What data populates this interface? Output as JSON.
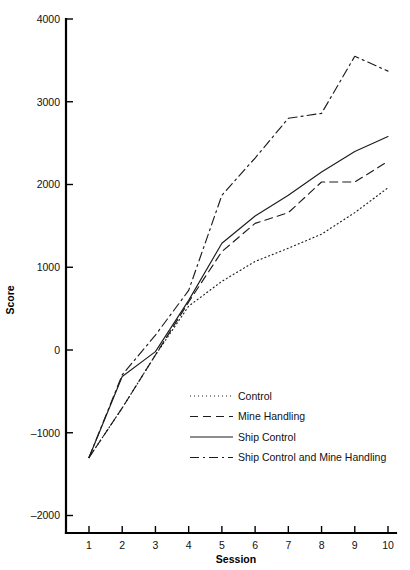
{
  "chart_data": {
    "type": "line",
    "title": "",
    "xlabel": "Session",
    "ylabel": "Score",
    "x": [
      1,
      2,
      3,
      4,
      5,
      6,
      7,
      8,
      9,
      10
    ],
    "xticklabels": [
      "1",
      "2",
      "3",
      "4",
      "5",
      "6",
      "7",
      "8",
      "9",
      "10"
    ],
    "yticks": [
      -2000,
      -1000,
      0,
      1000,
      2000,
      3000,
      4000
    ],
    "yticklabels": [
      "-2000",
      "-1000",
      "0",
      "1000",
      "2000",
      "3000",
      "4000"
    ],
    "xlim": [
      0.55,
      10.35
    ],
    "ylim": [
      -2400,
      4000
    ],
    "grid": false,
    "legend_position": "center-right-inside",
    "series": [
      {
        "name": "Control",
        "style": "dotted",
        "dash": "1,3",
        "values": [
          -1300,
          -700,
          -60,
          530,
          830,
          1070,
          1230,
          1400,
          1660,
          1960
        ]
      },
      {
        "name": "Mine Handling",
        "style": "dashed",
        "dash": "8,5",
        "values": [
          -1300,
          -700,
          -60,
          580,
          1190,
          1530,
          1660,
          2030,
          2030,
          2280
        ]
      },
      {
        "name": "Ship Control",
        "style": "solid",
        "dash": "none",
        "values": [
          -1300,
          -320,
          -20,
          600,
          1290,
          1620,
          1870,
          2150,
          2400,
          2580
        ]
      },
      {
        "name": "Ship Control and Mine Handling",
        "style": "dash-dot",
        "dash": "9,4,2,4",
        "values": [
          -1300,
          -300,
          180,
          720,
          1870,
          2320,
          2800,
          2860,
          3550,
          3370
        ]
      }
    ]
  },
  "legend": {
    "items": [
      {
        "label": "Control"
      },
      {
        "label": "Mine Handling"
      },
      {
        "label": "Ship Control"
      },
      {
        "label": "Ship Control and Mine Handling"
      }
    ]
  }
}
